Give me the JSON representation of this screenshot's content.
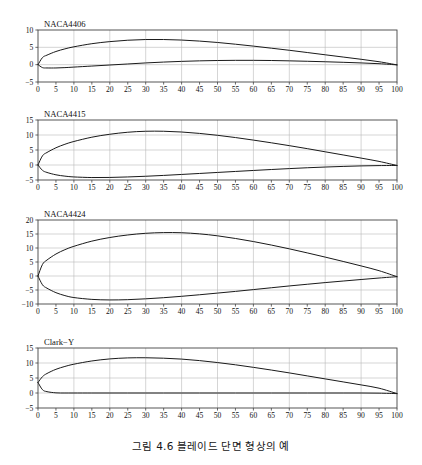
{
  "figure": {
    "caption": "그림 4.6  블레이드 단면 형상의 예",
    "background_color": "#ffffff",
    "line_color": "#1a1a1a",
    "grid_color": "#b9b9b9",
    "axis_color": "#444444"
  },
  "charts": [
    {
      "id": "naca4406",
      "title": "NACA4406",
      "xlabel": "",
      "ylabel": "",
      "xticks": [
        0,
        5,
        10,
        15,
        20,
        25,
        30,
        35,
        40,
        45,
        50,
        55,
        60,
        65,
        70,
        75,
        80,
        85,
        90,
        95,
        100
      ],
      "yticks": [
        -5,
        0,
        5,
        10
      ],
      "gridx": [
        0,
        10,
        20,
        30,
        40,
        50,
        60,
        70,
        80,
        90,
        100
      ],
      "xlim": [
        0,
        100
      ],
      "ylim": [
        -5,
        10
      ]
    },
    {
      "id": "naca4415",
      "title": "NACA4415",
      "xlabel": "",
      "ylabel": "",
      "xticks": [
        0,
        5,
        10,
        15,
        20,
        25,
        30,
        35,
        40,
        45,
        50,
        55,
        60,
        65,
        70,
        75,
        80,
        85,
        90,
        95,
        100
      ],
      "yticks": [
        -5,
        0,
        5,
        10,
        15
      ],
      "gridx": [
        0,
        10,
        20,
        30,
        40,
        50,
        60,
        70,
        80,
        90,
        100
      ],
      "xlim": [
        0,
        100
      ],
      "ylim": [
        -5,
        15
      ]
    },
    {
      "id": "naca4424",
      "title": "NACA4424",
      "xlabel": "",
      "ylabel": "",
      "xticks": [
        0,
        5,
        10,
        15,
        20,
        25,
        30,
        35,
        40,
        45,
        50,
        55,
        60,
        65,
        70,
        75,
        80,
        85,
        90,
        95,
        100
      ],
      "yticks": [
        -10,
        -5,
        0,
        5,
        10,
        15,
        20
      ],
      "gridx": [
        0,
        10,
        20,
        30,
        40,
        50,
        60,
        70,
        80,
        90,
        100
      ],
      "xlim": [
        0,
        100
      ],
      "ylim": [
        -10,
        20
      ]
    },
    {
      "id": "clark-y",
      "title": "Clark−Y",
      "xlabel": "",
      "ylabel": "",
      "xticks": [
        0,
        5,
        10,
        15,
        20,
        25,
        30,
        35,
        40,
        45,
        50,
        55,
        60,
        65,
        70,
        75,
        80,
        85,
        90,
        95,
        100
      ],
      "yticks": [
        -5,
        0,
        5,
        10,
        15
      ],
      "gridx": [
        0,
        10,
        20,
        30,
        40,
        50,
        60,
        70,
        80,
        90,
        100
      ],
      "xlim": [
        0,
        100
      ],
      "ylim": [
        -5,
        15
      ]
    }
  ],
  "chart_data": [
    {
      "type": "line",
      "title": "NACA4406",
      "xlabel": "",
      "ylabel": "",
      "xlim": [
        0,
        100
      ],
      "ylim": [
        -5,
        10
      ],
      "grid": true,
      "legend": "none",
      "series": [
        {
          "name": "upper surface",
          "x": [
            0,
            1.25,
            2.5,
            5,
            7.5,
            10,
            15,
            20,
            25,
            30,
            35,
            40,
            45,
            50,
            55,
            60,
            65,
            70,
            75,
            80,
            85,
            90,
            95,
            100
          ],
          "y": [
            0,
            2.05,
            2.75,
            3.8,
            4.55,
            5.15,
            6.05,
            6.65,
            7.05,
            7.25,
            7.25,
            7.1,
            6.8,
            6.4,
            5.9,
            5.35,
            4.75,
            4.15,
            3.5,
            2.85,
            2.2,
            1.55,
            0.85,
            -0.06
          ]
        },
        {
          "name": "lower surface",
          "x": [
            0,
            1.25,
            2.5,
            5,
            7.5,
            10,
            15,
            20,
            25,
            30,
            35,
            40,
            45,
            50,
            55,
            60,
            65,
            70,
            75,
            80,
            85,
            90,
            95,
            100
          ],
          "y": [
            0,
            -0.85,
            -0.95,
            -0.95,
            -0.85,
            -0.7,
            -0.4,
            -0.1,
            0.2,
            0.5,
            0.75,
            0.95,
            1.1,
            1.2,
            1.25,
            1.25,
            1.2,
            1.1,
            0.98,
            0.84,
            0.68,
            0.5,
            0.28,
            -0.06
          ]
        }
      ]
    },
    {
      "type": "line",
      "title": "NACA4415",
      "xlabel": "",
      "ylabel": "",
      "xlim": [
        0,
        100
      ],
      "ylim": [
        -5,
        15
      ],
      "grid": true,
      "legend": "none",
      "series": [
        {
          "name": "upper surface",
          "x": [
            0,
            1.25,
            2.5,
            5,
            7.5,
            10,
            15,
            20,
            25,
            30,
            35,
            40,
            45,
            50,
            55,
            60,
            65,
            70,
            75,
            80,
            85,
            90,
            95,
            100
          ],
          "y": [
            0,
            3.07,
            4.17,
            5.74,
            6.91,
            7.84,
            9.27,
            10.25,
            10.92,
            11.25,
            11.25,
            11.0,
            10.53,
            9.9,
            9.15,
            8.3,
            7.4,
            6.45,
            5.45,
            4.4,
            3.35,
            2.3,
            1.2,
            -0.16
          ]
        },
        {
          "name": "lower surface",
          "x": [
            0,
            1.25,
            2.5,
            5,
            7.5,
            10,
            15,
            20,
            25,
            30,
            35,
            40,
            45,
            50,
            55,
            60,
            65,
            70,
            75,
            80,
            85,
            90,
            95,
            100
          ],
          "y": [
            0,
            -1.79,
            -2.48,
            -3.27,
            -3.71,
            -3.98,
            -4.18,
            -4.15,
            -3.98,
            -3.75,
            -3.47,
            -3.15,
            -2.82,
            -2.48,
            -2.15,
            -1.82,
            -1.5,
            -1.2,
            -0.92,
            -0.68,
            -0.47,
            -0.3,
            -0.2,
            -0.16
          ]
        }
      ]
    },
    {
      "type": "line",
      "title": "NACA4424",
      "xlabel": "",
      "ylabel": "",
      "xlim": [
        0,
        100
      ],
      "ylim": [
        -10,
        20
      ],
      "grid": true,
      "legend": "none",
      "series": [
        {
          "name": "upper surface",
          "x": [
            0,
            1.25,
            2.5,
            5,
            7.5,
            10,
            15,
            20,
            25,
            30,
            35,
            40,
            45,
            50,
            55,
            60,
            65,
            70,
            75,
            80,
            85,
            90,
            95,
            100
          ],
          "y": [
            0,
            4.15,
            5.7,
            7.85,
            9.4,
            10.6,
            12.45,
            13.75,
            14.65,
            15.25,
            15.5,
            15.45,
            15.05,
            14.35,
            13.4,
            12.3,
            11.05,
            9.7,
            8.25,
            6.75,
            5.2,
            3.6,
            1.9,
            -0.25
          ]
        },
        {
          "name": "lower surface",
          "x": [
            0,
            1.25,
            2.5,
            5,
            7.5,
            10,
            15,
            20,
            25,
            30,
            35,
            40,
            45,
            50,
            55,
            60,
            65,
            70,
            75,
            80,
            85,
            90,
            95,
            100
          ],
          "y": [
            0,
            -3.15,
            -4.35,
            -5.95,
            -7.0,
            -7.7,
            -8.35,
            -8.55,
            -8.45,
            -8.15,
            -7.75,
            -7.25,
            -6.7,
            -6.1,
            -5.5,
            -4.85,
            -4.2,
            -3.55,
            -2.95,
            -2.35,
            -1.8,
            -1.25,
            -0.72,
            -0.25
          ]
        }
      ]
    },
    {
      "type": "line",
      "title": "Clark−Y",
      "xlabel": "",
      "ylabel": "",
      "xlim": [
        0,
        100
      ],
      "ylim": [
        -5,
        15
      ],
      "grid": true,
      "legend": "none",
      "series": [
        {
          "name": "upper surface",
          "x": [
            0,
            1.25,
            2.5,
            5,
            7.5,
            10,
            15,
            20,
            25,
            30,
            35,
            40,
            45,
            50,
            55,
            60,
            65,
            70,
            75,
            80,
            85,
            90,
            95,
            100
          ],
          "y": [
            3.5,
            5.45,
            6.5,
            7.9,
            8.85,
            9.6,
            10.68,
            11.36,
            11.7,
            11.75,
            11.6,
            11.3,
            10.8,
            10.15,
            9.4,
            8.55,
            7.65,
            6.7,
            5.7,
            4.7,
            3.7,
            2.7,
            1.6,
            -0.2
          ]
        },
        {
          "name": "lower surface",
          "x": [
            0,
            1.25,
            2.5,
            5,
            7.5,
            10,
            15,
            20,
            25,
            30,
            35,
            40,
            45,
            50,
            55,
            60,
            65,
            70,
            75,
            80,
            85,
            90,
            95,
            100
          ],
          "y": [
            3.5,
            1.1,
            0.45,
            0.05,
            0.0,
            0.0,
            0.0,
            0.0,
            0.0,
            0.0,
            0.0,
            0.0,
            0.0,
            0.0,
            0.0,
            0.0,
            0.0,
            0.0,
            0.0,
            0.0,
            0.0,
            0.0,
            -0.05,
            -0.2
          ]
        }
      ]
    }
  ]
}
